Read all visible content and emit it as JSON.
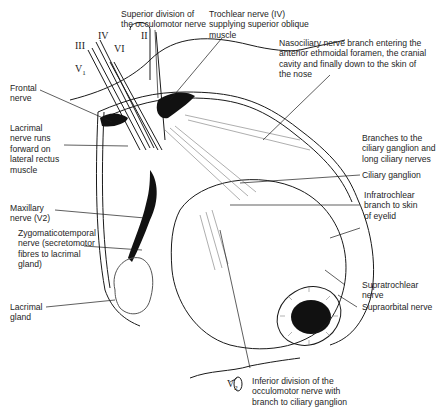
{
  "diagram": {
    "nerve_markers": {
      "oculomotor": "III",
      "trochlear": "IV",
      "abducens": "VI",
      "optic": "II",
      "ophthalmic": "V",
      "ophthalmic_sub": "1",
      "maxillary_bottom": "V",
      "maxillary_bottom_sub": "2"
    },
    "labels": {
      "superior_division": "Superior division of\nthe occulomotor nerve",
      "trochlear_nerve": "Trochlear nerve (IV)\nsupplying superior oblique\nmuscle",
      "nasociliary": "Nasociliary nerve branch entering the\nanterior ethmoidal foramen, the cranial\ncavity and finally down to the skin of\nthe nose",
      "frontal_nerve": "Frontal\nnerve",
      "lacrimal_nerve": "Lacrimal\nnerve runs\nforward on\nlateral rectus\nmuscle",
      "branches_ciliary": "Branches to the\nciliary ganglion and\nlong ciliary nerves",
      "ciliary_ganglion": "Ciliary ganglion",
      "infratrochlear": "Infratrochlear\nbranch to skin\nof eyelid",
      "maxillary_nerve": "Maxillary\nnerve (V2)",
      "zygomaticotemporal": "Zygomaticotemporal\nnerve (secretomotor\nfibres to lacrimal\ngland)",
      "lacrimal_gland": "Lacrimal\ngland",
      "supratrochlear": "Supratrochlear\nnerve",
      "supraorbital": "Supraorbital nerve",
      "inferior_division": "Inferior division of the\nocculomotor nerve with\nbranch to ciliary ganglion"
    },
    "colors": {
      "ink": "#1a1a1a",
      "background": "#ffffff",
      "hatch": "#777777"
    }
  }
}
